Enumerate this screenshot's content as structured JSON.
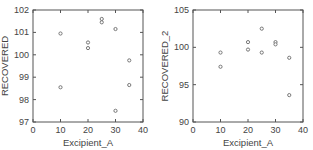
{
  "chart_data": [
    {
      "type": "scatter",
      "title": "",
      "xlabel": "Excipient_A",
      "ylabel": "RECOVERED",
      "xlim": [
        0,
        40
      ],
      "ylim": [
        97,
        102
      ],
      "xticks": [
        0,
        10,
        20,
        30,
        40
      ],
      "yticks": [
        97,
        98,
        99,
        100,
        101,
        102
      ],
      "grid": false,
      "legend": null,
      "x": [
        10,
        10,
        20,
        20,
        25,
        25,
        30,
        30,
        35,
        35
      ],
      "y": [
        100.95,
        98.55,
        100.55,
        100.3,
        101.6,
        101.45,
        101.15,
        97.5,
        99.75,
        98.65
      ]
    },
    {
      "type": "scatter",
      "title": "",
      "xlabel": "Excipient_A",
      "ylabel": "RECOVERED_2",
      "xlim": [
        0,
        40
      ],
      "ylim": [
        90,
        105
      ],
      "xticks": [
        0,
        10,
        20,
        30,
        40
      ],
      "yticks": [
        90,
        95,
        100,
        105
      ],
      "grid": false,
      "legend": null,
      "x": [
        10,
        10,
        20,
        20,
        25,
        25,
        30,
        30,
        35,
        35
      ],
      "y": [
        99.3,
        97.4,
        100.7,
        99.7,
        102.5,
        99.3,
        100.7,
        100.4,
        98.6,
        93.6
      ]
    }
  ],
  "colors": {
    "frame": "#555555",
    "marker_edge": "#777777",
    "text": "#444444"
  }
}
